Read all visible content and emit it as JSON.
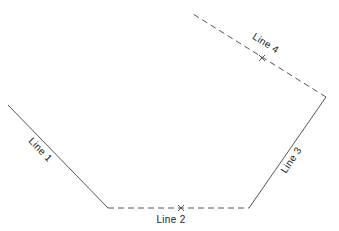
{
  "diagram": {
    "background": "#ffffff",
    "stroke_color": "#555555",
    "lines": [
      {
        "label": "Line 1",
        "style": "solid",
        "x1": 8,
        "y1": 105,
        "x2": 108,
        "y2": 208,
        "label_x": 38,
        "label_y": 152,
        "label_angle": 46
      },
      {
        "label": "Line 2",
        "style": "dashed",
        "x1": 108,
        "y1": 208,
        "x2": 249,
        "y2": 208,
        "label_x": 171,
        "label_y": 223,
        "label_angle": 0,
        "marker": {
          "type": "x",
          "x": 181,
          "y": 208
        }
      },
      {
        "label": "Line 3",
        "style": "solid",
        "x1": 249,
        "y1": 208,
        "x2": 326,
        "y2": 97,
        "label_x": 294,
        "label_y": 162,
        "label_angle": -56
      },
      {
        "label": "Line 4",
        "style": "dashed",
        "x1": 326,
        "y1": 97,
        "x2": 193,
        "y2": 14,
        "label_x": 264,
        "label_y": 46,
        "label_angle": 32,
        "marker": {
          "type": "x",
          "x": 262,
          "y": 58
        }
      }
    ]
  }
}
